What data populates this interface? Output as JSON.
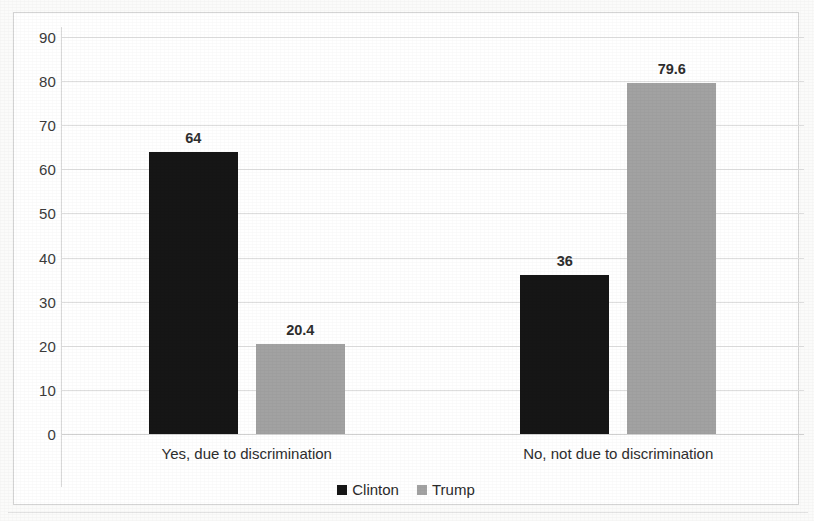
{
  "chart_data": {
    "type": "bar",
    "title": "",
    "subtitle": "",
    "xlabel": "",
    "ylabel": "",
    "categories": [
      "Yes, due to discrimination",
      "No, not due to discrimination"
    ],
    "series": [
      {
        "name": "Clinton",
        "color": "#161616",
        "values": [
          64,
          36
        ],
        "labels": [
          "64",
          "36"
        ]
      },
      {
        "name": "Trump",
        "color": "#a2a2a2",
        "values": [
          20.4,
          79.6
        ],
        "labels": [
          "20.4",
          "79.6"
        ]
      }
    ],
    "ylim": [
      0,
      90
    ],
    "ytick_labels": [
      "90",
      "80",
      "70",
      "60",
      "50",
      "40",
      "30",
      "20",
      "10",
      "0"
    ],
    "ytick_values": [
      90,
      80,
      70,
      60,
      50,
      40,
      30,
      20,
      10,
      0
    ],
    "ytick_step": 10,
    "grid": true,
    "grid_axis": "y",
    "legend": [
      "Clinton",
      "Trump"
    ],
    "legend_position": "bottom",
    "data_labels": true
  },
  "legend": {
    "items": [
      {
        "label": "Clinton",
        "color": "#161616"
      },
      {
        "label": "Trump",
        "color": "#a2a2a2"
      }
    ]
  }
}
